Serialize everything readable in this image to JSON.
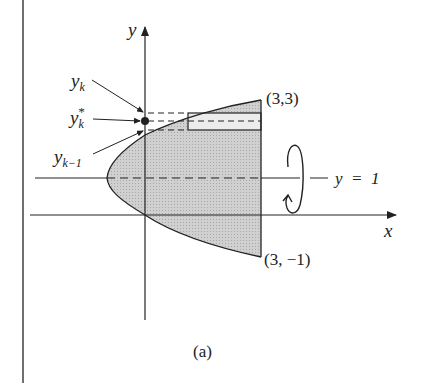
{
  "figure": {
    "caption": "(a)",
    "axes": {
      "x_label": "x",
      "y_label": "y"
    },
    "points": {
      "top": "(3,3)",
      "bottom": "(3, −1)"
    },
    "axis_of_rotation": {
      "label": "y  =  1"
    },
    "slice_labels": {
      "yk": {
        "base": "y",
        "sub": "k"
      },
      "yk_star": {
        "base": "y",
        "sub": "k",
        "sup": "*"
      },
      "yk_minus_1": {
        "base": "y",
        "sub": "k−1"
      }
    },
    "colors": {
      "region_fill": "#c8c8c8",
      "slice_fill": "#e6e6e6",
      "stroke": "#222222"
    }
  }
}
